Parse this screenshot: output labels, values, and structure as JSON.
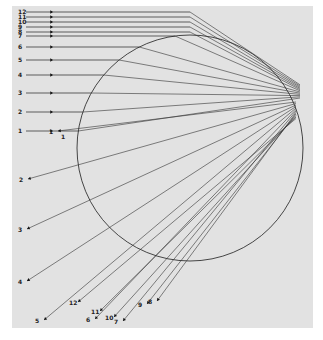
{
  "figure": {
    "background": "#e2e2e2",
    "paper_area": {
      "x": 12,
      "y": 6,
      "w": 301,
      "h": 322
    },
    "circle": {
      "cx": 190,
      "cy": 148,
      "r": 113,
      "stroke": "#333333"
    },
    "focus_point": {
      "x": 300,
      "y": 92
    },
    "incoming_rays": [
      {
        "label": "12",
        "y": 12
      },
      {
        "label": "11",
        "y": 17
      },
      {
        "label": "10",
        "y": 22
      },
      {
        "label": "9",
        "y": 27
      },
      {
        "label": "8",
        "y": 32
      },
      {
        "label": "7",
        "y": 36
      },
      {
        "label": "6",
        "y": 47
      },
      {
        "label": "5",
        "y": 60
      },
      {
        "label": "4",
        "y": 75
      },
      {
        "label": "3",
        "y": 93
      },
      {
        "label": "2",
        "y": 112
      },
      {
        "label": "1",
        "y": 131
      }
    ],
    "extra_label": {
      "text": "1",
      "x": 61,
      "y": 139
    },
    "outgoing_rays": [
      {
        "label": "1",
        "x": 58,
        "y": 131
      },
      {
        "label": "2",
        "x": 28,
        "y": 179
      },
      {
        "label": "3",
        "x": 27,
        "y": 229
      },
      {
        "label": "4",
        "x": 27,
        "y": 281
      },
      {
        "label": "5",
        "x": 44,
        "y": 320
      },
      {
        "label": "6",
        "x": 95,
        "y": 319
      },
      {
        "label": "7",
        "x": 123,
        "y": 321
      },
      {
        "label": "8",
        "x": 157,
        "y": 301
      },
      {
        "label": "9",
        "x": 147,
        "y": 304
      },
      {
        "label": "10",
        "x": 114,
        "y": 317
      },
      {
        "label": "11",
        "x": 100,
        "y": 311
      },
      {
        "label": "12",
        "x": 78,
        "y": 302
      }
    ]
  }
}
